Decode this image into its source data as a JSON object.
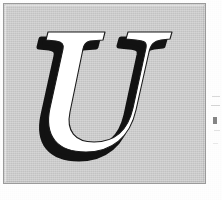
{
  "document": {
    "kind": "scanned-page-fragment",
    "page_background": "#fefefe",
    "caption": ""
  },
  "panel": {
    "name": "drop-cap-panel",
    "background_color": "#c9c9c9",
    "border_color": "#9a9a9a",
    "border_width_px": 1,
    "x": 3,
    "y": 3,
    "width": 203,
    "height": 181
  },
  "letter": {
    "character": "U",
    "style": "italic serif capital",
    "face_color": "#ffffff",
    "shadow_color": "#111111",
    "shadow_offset_x": -7,
    "shadow_offset_y": 7,
    "outline_color": "#111111",
    "bounds": {
      "x": 38,
      "y": 28,
      "width": 134,
      "height": 120
    }
  },
  "edge_marks": {
    "label": "faint bleed-through marks at right page edge",
    "count": 5,
    "color": "#b9b9b9"
  }
}
